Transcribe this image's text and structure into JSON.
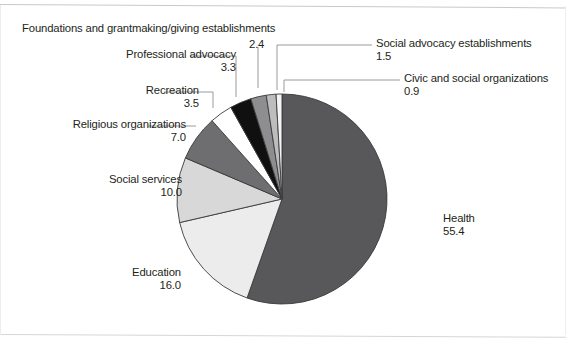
{
  "chart_data": {
    "type": "pie",
    "title": "",
    "subtitle": "",
    "xlabel": "",
    "ylabel": "",
    "legend_position": "none",
    "value_suffix": "",
    "total": 100.0,
    "start_angle_deg": 0,
    "direction": "clockwise",
    "categories": [
      "Health",
      "Education",
      "Social services",
      "Religious organizations",
      "Recreation",
      "Professional advocacy",
      "Foundations and grantmaking/giving establishments",
      "Social advocacy establishments",
      "Civic and social organizations"
    ],
    "values": [
      55.4,
      16.0,
      10.0,
      7.0,
      3.5,
      3.3,
      2.4,
      1.5,
      0.9
    ],
    "value_labels": [
      "55.4",
      "16.0",
      "10.0",
      "7.0",
      "3.5",
      "3.3",
      "2.4",
      "1.5",
      "0.9"
    ],
    "colors": [
      "#58585a",
      "#ececec",
      "#d8d8d8",
      "#6e6e70",
      "#ffffff",
      "#101010",
      "#8e8e90",
      "#bdbdbd",
      "#f4f4f4"
    ],
    "slice_border_color": "#3a3a3a"
  },
  "labels": {
    "foundations": {
      "category": "Foundations and grantmaking/giving establishments",
      "value": "2.4"
    },
    "professional_advocacy": {
      "category": "Professional advocacy",
      "value": "3.3"
    },
    "recreation": {
      "category": "Recreation",
      "value": "3.5"
    },
    "religious": {
      "category": "Religious organizations",
      "value": "7.0"
    },
    "social_services": {
      "category": "Social services",
      "value": "10.0"
    },
    "education": {
      "category": "Education",
      "value": "16.0"
    },
    "health": {
      "category": "Health",
      "value": "55.4"
    },
    "social_advocacy": {
      "category": "Social advocacy establishments",
      "value": "1.5"
    },
    "civic": {
      "category": "Civic and social organizations",
      "value": "0.9"
    }
  }
}
